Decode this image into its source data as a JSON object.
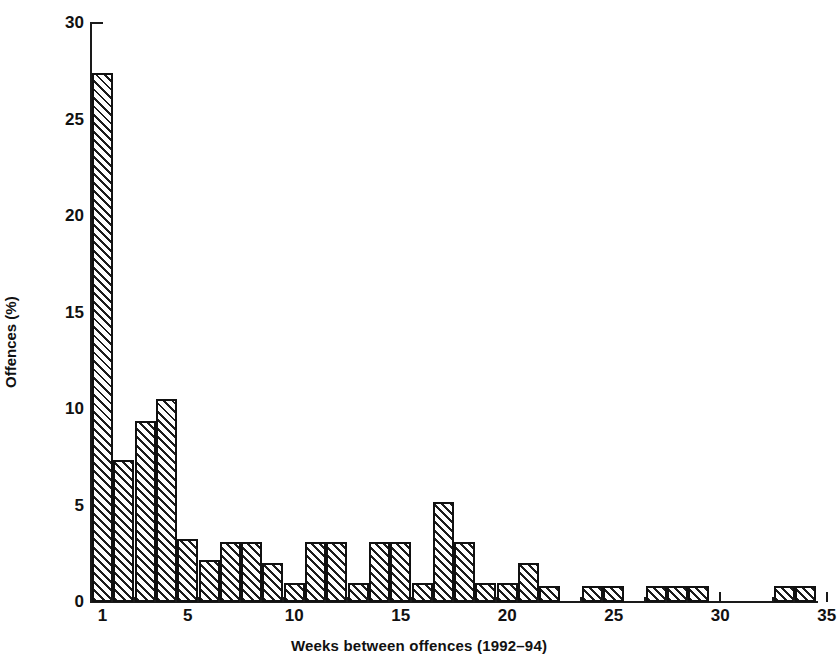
{
  "chart_data": {
    "type": "bar",
    "title": "",
    "xlabel": "Weeks between offences (1992–94)",
    "ylabel": "Offences (%)",
    "xlim": [
      0.2,
      35.6
    ],
    "ylim": [
      0,
      30
    ],
    "grid": false,
    "legend": "none",
    "x_ticks": [
      1,
      5,
      10,
      15,
      20,
      25,
      30,
      35
    ],
    "x_tick_labels": [
      "1",
      "5",
      "10",
      "15",
      "20",
      "25",
      "30",
      "35"
    ],
    "y_ticks": [
      0,
      5,
      10,
      15,
      20,
      25,
      30
    ],
    "y_tick_labels": [
      "0",
      "5",
      "10",
      "15",
      "20",
      "25",
      "30"
    ],
    "bar_style": "diagonal-hatch",
    "categories": [
      1,
      2,
      3,
      4,
      5,
      6,
      7,
      8,
      9,
      10,
      11,
      12,
      13,
      14,
      15,
      16,
      17,
      18,
      19,
      20,
      21,
      22,
      24,
      25,
      27,
      28,
      29,
      33,
      34
    ],
    "values": [
      27.4,
      7.35,
      9.4,
      10.5,
      3.25,
      2.2,
      3.1,
      3.1,
      2.0,
      1.0,
      3.1,
      3.1,
      1.0,
      3.1,
      3.1,
      1.0,
      5.2,
      3.1,
      1.0,
      1.0,
      2.0,
      0.85,
      0.85,
      0.85,
      0.85,
      0.85,
      0.85,
      0.85,
      0.85
    ],
    "series": [
      {
        "name": "Offences (%)",
        "points": [
          {
            "week": 1,
            "value": 27.4
          },
          {
            "week": 2,
            "value": 7.35
          },
          {
            "week": 3,
            "value": 9.4
          },
          {
            "week": 4,
            "value": 10.5
          },
          {
            "week": 5,
            "value": 3.25
          },
          {
            "week": 6,
            "value": 2.2
          },
          {
            "week": 7,
            "value": 3.1
          },
          {
            "week": 8,
            "value": 3.1
          },
          {
            "week": 9,
            "value": 2.0
          },
          {
            "week": 10,
            "value": 1.0
          },
          {
            "week": 11,
            "value": 3.1
          },
          {
            "week": 12,
            "value": 3.1
          },
          {
            "week": 13,
            "value": 1.0
          },
          {
            "week": 14,
            "value": 3.1
          },
          {
            "week": 15,
            "value": 3.1
          },
          {
            "week": 16,
            "value": 1.0
          },
          {
            "week": 17,
            "value": 5.2
          },
          {
            "week": 18,
            "value": 3.1
          },
          {
            "week": 19,
            "value": 1.0
          },
          {
            "week": 20,
            "value": 1.0
          },
          {
            "week": 21,
            "value": 2.0
          },
          {
            "week": 22,
            "value": 0.85
          },
          {
            "week": 24,
            "value": 0.85
          },
          {
            "week": 25,
            "value": 0.85
          },
          {
            "week": 27,
            "value": 0.85
          },
          {
            "week": 28,
            "value": 0.85
          },
          {
            "week": 29,
            "value": 0.85
          },
          {
            "week": 33,
            "value": 0.85
          },
          {
            "week": 34,
            "value": 0.85
          }
        ]
      }
    ],
    "colors": {
      "axis": "#1a1a1a",
      "bar_outline": "#111111",
      "bar_hatch": "#1d1d1d",
      "bar_fill": "#ffffff",
      "background": "#ffffff"
    }
  }
}
